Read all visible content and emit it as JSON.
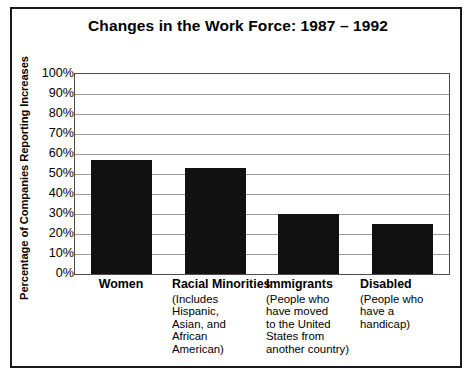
{
  "chart_data": {
    "type": "bar",
    "title": "Changes in the Work Force: 1987 – 1992",
    "xlabel": "",
    "ylabel": "Percentage of Companies Reporting Increases",
    "ylim": [
      0,
      100
    ],
    "grid": true,
    "legend": "none",
    "categories": [
      "Women",
      "Racial Minorities",
      "Immigrants",
      "Disabled"
    ],
    "category_subtitles": [
      "",
      "(Includes Hispanic, Asian, and African American)",
      "(People who have moved to the United States from another country)",
      "(People who have a handicap)"
    ],
    "values": [
      57,
      53,
      30,
      25
    ],
    "value_labels": [
      "57%",
      "53%",
      "30%",
      "25%"
    ],
    "ytick_labels": [
      "100%",
      "90%",
      "80%",
      "70%",
      "60%",
      "50%",
      "40%",
      "30%",
      "20%",
      "10%",
      "0%"
    ],
    "ytick_values": [
      100,
      90,
      80,
      70,
      60,
      50,
      40,
      30,
      20,
      10,
      0
    ],
    "bar_color": "#111111",
    "grid_color": "#9a9a9a",
    "axis_color": "#4d4d4d",
    "frame_color": "#1a1a1a",
    "background": "#ffffff"
  },
  "categories_display": [
    {
      "name": "Women",
      "sub_lines": []
    },
    {
      "name": "Racial Minorities",
      "sub_lines": [
        "(Includes Hispanic,",
        "Asian, and",
        "African American)"
      ]
    },
    {
      "name": "Immigrants",
      "sub_lines": [
        "(People who",
        "have moved",
        "to the United",
        "States from",
        "another country)"
      ]
    },
    {
      "name": "Disabled",
      "sub_lines": [
        "(People who",
        "have a",
        "handicap)"
      ]
    }
  ]
}
